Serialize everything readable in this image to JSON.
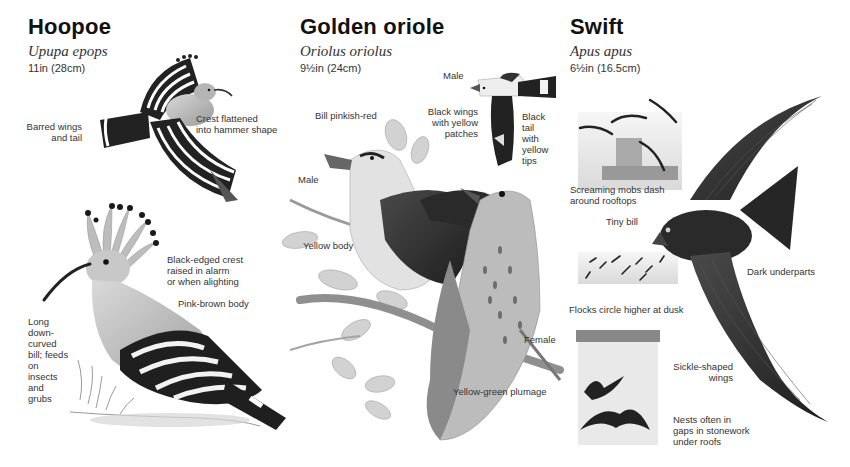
{
  "species": [
    {
      "name": "Hoopoe",
      "latin": "Upupa epops",
      "size": "11in (28cm)",
      "labels": {
        "barred": "Barred wings\nand tail",
        "crest_flat": "Crest flattened\ninto hammer shape",
        "crest_raised": "Black-edged crest\nraised in alarm\nor when alighting",
        "body": "Pink-brown body",
        "bill": "Long\ndown-\ncurved\nbill; feeds\non\ninsects\nand\ngrubs"
      }
    },
    {
      "name": "Golden oriole",
      "latin": "Oriolus oriolus",
      "size": "9½in (24cm)",
      "labels": {
        "male_flying": "Male",
        "bill": "Bill pinkish-red",
        "wings": "Black wings\nwith yellow\npatches",
        "tail": "Black\ntail\nwith\nyellow\ntips",
        "male_perched": "Male",
        "body": "Yellow body",
        "female": "Female",
        "plumage": "Yellow-green plumage"
      }
    },
    {
      "name": "Swift",
      "latin": "Apus apus",
      "size": "6½in (16.5cm)",
      "labels": {
        "mobs": "Screaming mobs dash\naround rooftops",
        "bill": "Tiny bill",
        "underparts": "Dark underparts",
        "flocks": "Flocks circle higher at dusk",
        "wings": "Sickle-shaped\nwings",
        "nests": "Nests often in\ngaps in stonework\nunder roofs"
      }
    }
  ],
  "colors": {
    "ink": "#111111",
    "dark_plumage": "#2e2e2e",
    "mid_plumage": "#8a8a8a",
    "light_plumage": "#d6d6d6",
    "foliage": "#c4c4c4"
  }
}
